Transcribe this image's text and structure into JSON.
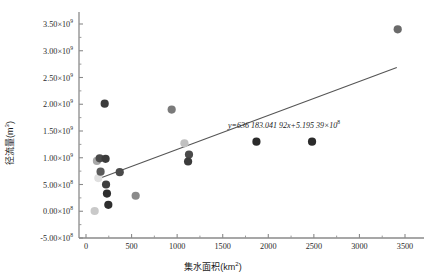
{
  "chart_data": {
    "type": "scatter",
    "title": "",
    "xlabel": "集水面积(km²)",
    "ylabel": "径流量(m³)",
    "xlim": [
      -200,
      3700
    ],
    "ylim": [
      -500000000,
      3700000000
    ],
    "grid": false,
    "legend": null,
    "xticks": [
      0,
      500,
      1000,
      1500,
      2000,
      2500,
      3000,
      3500
    ],
    "xtick_labels": [
      "0",
      "500",
      "1000",
      "1500",
      "2000",
      "2500",
      "3000",
      "3500"
    ],
    "yticks": [
      -500000000,
      0,
      500000000,
      1000000000,
      1500000000,
      2000000000,
      2500000000,
      3000000000,
      3500000000
    ],
    "ytick_labels": [
      {
        "mant": "-5.00×10",
        "exp": "8"
      },
      {
        "mant": "0.00×10",
        "exp": "8"
      },
      {
        "mant": "5.00×10",
        "exp": "8"
      },
      {
        "mant": "1.00×10",
        "exp": "9"
      },
      {
        "mant": "1.50×10",
        "exp": "9"
      },
      {
        "mant": "2.00×10",
        "exp": "9"
      },
      {
        "mant": "2.50×10",
        "exp": "9"
      },
      {
        "mant": "3.00×10",
        "exp": "9"
      },
      {
        "mant": "3.50×10",
        "exp": "9"
      }
    ],
    "points": [
      {
        "x": 95,
        "y": 5000000,
        "color": "#c9c9c9"
      },
      {
        "x": 120,
        "y": 940000000,
        "color": "#a8a8a8"
      },
      {
        "x": 135,
        "y": 620000000,
        "color": "#e0e0e0"
      },
      {
        "x": 150,
        "y": 990000000,
        "color": "#4a4a4a"
      },
      {
        "x": 160,
        "y": 740000000,
        "color": "#5a5a5a"
      },
      {
        "x": 205,
        "y": 2010000000,
        "color": "#3b3b3b"
      },
      {
        "x": 215,
        "y": 980000000,
        "color": "#3b3b3b"
      },
      {
        "x": 220,
        "y": 500000000,
        "color": "#3f3f3f"
      },
      {
        "x": 230,
        "y": 330000000,
        "color": "#2e2e2e"
      },
      {
        "x": 245,
        "y": 120000000,
        "color": "#2e2e2e"
      },
      {
        "x": 370,
        "y": 730000000,
        "color": "#4a4a4a"
      },
      {
        "x": 545,
        "y": 290000000,
        "color": "#8a8a8a"
      },
      {
        "x": 940,
        "y": 1900000000,
        "color": "#7a7a7a"
      },
      {
        "x": 1080,
        "y": 1270000000,
        "color": "#c0c0c0"
      },
      {
        "x": 1130,
        "y": 1060000000,
        "color": "#4a4a4a"
      },
      {
        "x": 1120,
        "y": 930000000,
        "color": "#3b3b3b"
      },
      {
        "x": 1870,
        "y": 1300000000,
        "color": "#2b2b2b"
      },
      {
        "x": 2480,
        "y": 1300000000,
        "color": "#2b2b2b"
      },
      {
        "x": 3420,
        "y": 3400000000,
        "color": "#6a6a6a"
      }
    ],
    "trendline": {
      "equation_display": "y=636 183.041 92x+5.195 39×10",
      "equation_exponent": "8",
      "slope": 636183.04192,
      "intercept": 519539000,
      "x_start": 100,
      "x_end": 3410,
      "color": "#555555"
    }
  },
  "axis": {
    "x_title": "集水面积(km",
    "x_title_unit": "2",
    "x_title_tail": ")",
    "y_title": "径流量(m",
    "y_title_unit": "3",
    "y_title_tail": ")"
  }
}
